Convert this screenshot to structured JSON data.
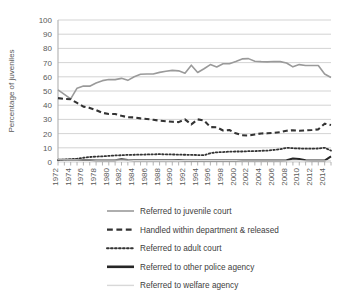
{
  "chart_data": {
    "type": "line",
    "title": "",
    "xlabel": "",
    "ylabel": "Percentage of juveniles",
    "ylim": [
      0,
      100
    ],
    "yticks": [
      0,
      10,
      20,
      30,
      40,
      50,
      60,
      70,
      80,
      90,
      100
    ],
    "xlim": [
      1972,
      2015
    ],
    "grid": true,
    "legend_position": "bottom",
    "x": [
      1972,
      1973,
      1974,
      1975,
      1976,
      1977,
      1978,
      1979,
      1980,
      1981,
      1982,
      1983,
      1984,
      1985,
      1986,
      1987,
      1988,
      1989,
      1990,
      1991,
      1992,
      1993,
      1994,
      1995,
      1996,
      1997,
      1998,
      1999,
      2000,
      2001,
      2002,
      2003,
      2004,
      2005,
      2006,
      2007,
      2008,
      2009,
      2010,
      2011,
      2012,
      2013,
      2014,
      2015
    ],
    "xticks": [
      1972,
      1974,
      1976,
      1978,
      1980,
      1982,
      1984,
      1986,
      1988,
      1990,
      1992,
      1994,
      1996,
      1998,
      2000,
      2002,
      2004,
      2006,
      2008,
      2010,
      2012,
      2014
    ],
    "xticklabels": [
      "1972",
      "1974",
      "1976",
      "1978",
      "1980",
      "1982",
      "1984",
      "1986",
      "1988",
      "1990",
      "1992",
      "1994",
      "1996",
      "1998",
      "2000",
      "2002",
      "2004",
      "2006",
      "2008",
      "2010",
      "2012",
      "2014"
    ],
    "series": [
      {
        "name": "Referred to juvenile court",
        "style": "solid",
        "color": "#9a9a9a",
        "width": 1.6,
        "values": [
          50.8,
          47.6,
          44.4,
          52.0,
          53.5,
          53.4,
          55.6,
          57.3,
          58.1,
          58.0,
          58.9,
          57.5,
          60.0,
          61.8,
          62.0,
          62.0,
          63.1,
          63.9,
          64.5,
          64.2,
          62.5,
          68.2,
          63.0,
          65.7,
          68.6,
          66.9,
          69.2,
          69.2,
          70.8,
          72.6,
          72.8,
          71.0,
          70.7,
          70.5,
          70.8,
          70.7,
          69.7,
          67.0,
          68.6,
          68.0,
          68.0,
          68.0,
          62.0,
          59.5
        ]
      },
      {
        "name": "Handled within department & released",
        "style": "dashed",
        "color": "#333333",
        "width": 2.1,
        "values": [
          45.0,
          44.4,
          44.2,
          41.6,
          39.0,
          38.1,
          36.6,
          34.6,
          33.8,
          33.8,
          32.5,
          31.5,
          31.4,
          30.7,
          30.3,
          29.7,
          29.1,
          28.7,
          28.3,
          28.1,
          30.0,
          26.5,
          30.0,
          29.2,
          24.6,
          24.5,
          22.2,
          22.5,
          20.2,
          18.8,
          18.6,
          19.4,
          20.1,
          20.2,
          20.5,
          21.0,
          22.0,
          22.4,
          22.0,
          22.3,
          22.5,
          23.0,
          27.0,
          26.0
        ]
      },
      {
        "name": "Referred to adult court",
        "style": "dotted",
        "color": "#333333",
        "width": 1.8,
        "values": [
          1.3,
          1.7,
          2.0,
          2.3,
          3.0,
          3.5,
          3.8,
          4.0,
          4.3,
          4.6,
          4.8,
          5.0,
          5.1,
          5.2,
          5.3,
          5.4,
          5.5,
          5.4,
          5.3,
          5.2,
          5.1,
          5.0,
          4.9,
          4.8,
          6.2,
          6.8,
          7.0,
          7.3,
          7.4,
          7.4,
          7.6,
          7.7,
          7.9,
          8.0,
          8.5,
          9.0,
          10.0,
          9.7,
          9.5,
          9.4,
          9.4,
          9.5,
          10.0,
          8.0
        ]
      },
      {
        "name": "Referred to other police agency",
        "style": "solid",
        "color": "#262626",
        "width": 2.0,
        "values": [
          1.6,
          1.5,
          1.5,
          1.5,
          1.4,
          1.4,
          1.3,
          1.3,
          1.3,
          1.3,
          2.0,
          1.4,
          1.3,
          1.3,
          1.3,
          1.2,
          1.2,
          1.2,
          1.2,
          1.2,
          1.1,
          1.1,
          1.1,
          1.1,
          1.1,
          1.1,
          1.1,
          1.0,
          1.0,
          1.0,
          1.0,
          1.0,
          1.0,
          1.0,
          1.0,
          1.0,
          1.2,
          2.4,
          2.2,
          1.3,
          1.1,
          1.0,
          1.0,
          4.0
        ]
      },
      {
        "name": "Referred to welfare agency",
        "style": "solid",
        "color": "#d8d8d8",
        "width": 1.2,
        "values": [
          1.6,
          1.5,
          1.5,
          1.5,
          1.4,
          1.4,
          1.3,
          1.3,
          1.3,
          1.3,
          1.3,
          1.3,
          1.2,
          1.2,
          1.2,
          1.1,
          1.1,
          1.1,
          1.1,
          1.0,
          1.0,
          1.0,
          1.0,
          1.0,
          1.0,
          0.9,
          0.9,
          0.9,
          0.9,
          0.8,
          0.8,
          0.8,
          0.8,
          0.8,
          0.8,
          0.8,
          0.8,
          0.8,
          0.8,
          0.8,
          0.8,
          0.8,
          0.8,
          0.8
        ]
      }
    ],
    "legend": [
      {
        "label": "Referred to juvenile court",
        "style": "solid",
        "color": "#9a9a9a",
        "width": 1.6
      },
      {
        "label": "Handled within department & released",
        "style": "dashed",
        "color": "#333333",
        "width": 2.4
      },
      {
        "label": "Referred to adult court",
        "style": "dotted",
        "color": "#333333",
        "width": 2.0
      },
      {
        "label": "Referred to other police agency",
        "style": "solid",
        "color": "#262626",
        "width": 2.6
      },
      {
        "label": "Referred to welfare agency",
        "style": "solid",
        "color": "#d8d8d8",
        "width": 1.4
      }
    ]
  },
  "layout": {
    "plot": {
      "left": 58,
      "top": 20,
      "right": 331,
      "bottom": 162
    },
    "grid_color": "#c8c8c8",
    "axis_color": "#bdbdbd",
    "background": "#ffffff"
  }
}
